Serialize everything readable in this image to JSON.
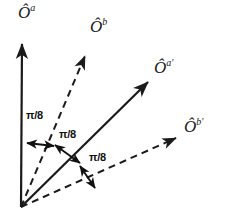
{
  "diagram": {
    "type": "vector-angle-diagram",
    "background_color": "#ffffff",
    "stroke_color": "#1a1a1a",
    "origin": {
      "x": 21,
      "y": 207
    },
    "vectors": [
      {
        "id": "O-a",
        "label_base": "Ô",
        "label_sup": "a",
        "style": "solid",
        "tip": {
          "x": 22,
          "y": 40
        },
        "label_pos": {
          "x": 18,
          "y": 3
        }
      },
      {
        "id": "O-b",
        "label_base": "Ô",
        "label_sup": "b",
        "style": "dashed",
        "tip": {
          "x": 88,
          "y": 52
        },
        "label_pos": {
          "x": 90,
          "y": 17
        }
      },
      {
        "id": "O-a-prime",
        "label_base": "Ô",
        "label_sup": "a′",
        "style": "solid",
        "tip": {
          "x": 152,
          "y": 78
        },
        "label_pos": {
          "x": 154,
          "y": 58
        }
      },
      {
        "id": "O-b-prime",
        "label_base": "Ô",
        "label_sup": "b′",
        "style": "dashed",
        "tip": {
          "x": 181,
          "y": 135
        },
        "label_pos": {
          "x": 184,
          "y": 117
        }
      }
    ],
    "angles": [
      {
        "id": "angle-1",
        "value": "π/8",
        "label_pos": {
          "x": 26,
          "y": 110
        },
        "between": [
          "O-a",
          "O-b"
        ]
      },
      {
        "id": "angle-2",
        "value": "π/8",
        "label_pos": {
          "x": 59,
          "y": 129
        },
        "between": [
          "O-b",
          "O-a-prime"
        ]
      },
      {
        "id": "angle-3",
        "value": "π/8",
        "label_pos": {
          "x": 89,
          "y": 152
        },
        "between": [
          "O-a-prime",
          "O-b-prime"
        ]
      }
    ]
  }
}
